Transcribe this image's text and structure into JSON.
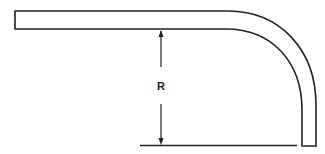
{
  "diagram": {
    "dimension_label": "R",
    "colors": {
      "line": "#222222",
      "background": "#ffffff"
    }
  }
}
